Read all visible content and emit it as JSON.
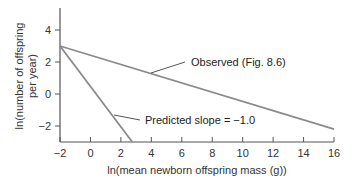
{
  "chart_data": {
    "type": "line",
    "title": "",
    "xlabel": "ln(mean newborn offspring mass (g))",
    "ylabel_line1": "ln(number of offspring",
    "ylabel_line2": "per year)",
    "xlim": [
      -2,
      16
    ],
    "ylim": [
      -3,
      5
    ],
    "x_ticks": [
      -2,
      0,
      2,
      4,
      6,
      8,
      10,
      12,
      14,
      16
    ],
    "x_tick_labels": [
      "−2",
      "0",
      "2",
      "4",
      "6",
      "8",
      "10",
      "12",
      "14",
      "16"
    ],
    "y_ticks": [
      4,
      2,
      0,
      -2
    ],
    "y_tick_labels": [
      "4",
      "2",
      "0",
      "−2"
    ],
    "grid": false,
    "series": [
      {
        "name": "Observed (Fig. 8.6)",
        "x": [
          -2,
          16
        ],
        "y": [
          3,
          -2.2
        ],
        "color": "#8a8a8a"
      },
      {
        "name": "Predicted slope = −1.0",
        "x": [
          -2,
          2.75
        ],
        "y": [
          3,
          -3
        ],
        "color": "#8a8a8a"
      }
    ],
    "annotations": [
      {
        "text": "Observed (Fig. 8.6)",
        "points_to": [
          4,
          1.3
        ]
      },
      {
        "text": "Predicted slope = −1.0",
        "points_to": [
          1.3,
          -1.4
        ]
      }
    ]
  },
  "colors": {
    "axis": "#555555",
    "line": "#8a8a8a",
    "text": "#333333"
  }
}
